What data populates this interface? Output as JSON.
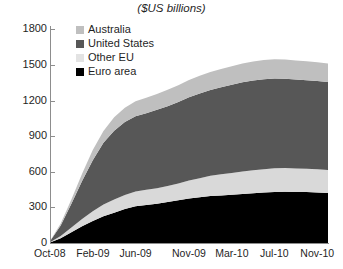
{
  "chart_data": {
    "type": "area",
    "title": "($US billions)",
    "xlabel": "",
    "ylabel": "",
    "ylim": [
      0,
      1800
    ],
    "yticks": [
      0,
      300,
      600,
      900,
      1200,
      1500,
      1800
    ],
    "grid": false,
    "stacked": true,
    "legend_position": "top-left-inside",
    "x": [
      "Oct-08",
      "Nov-08",
      "Dec-08",
      "Jan-09",
      "Feb-09",
      "Mar-09",
      "Apr-09",
      "May-09",
      "Jun-09",
      "Jul-09",
      "Aug-09",
      "Sep-09",
      "Oct-09",
      "Nov-09",
      "Dec-09",
      "Jan-10",
      "Feb-10",
      "Mar-10",
      "Apr-10",
      "May-10",
      "Jun-10",
      "Jul-10",
      "Aug-10",
      "Sep-10",
      "Oct-10",
      "Nov-10",
      "Dec-10"
    ],
    "tick_labels": [
      "Oct-08",
      "Feb-09",
      "Jun-09",
      "Nov-09",
      "Mar-10",
      "Jul-10",
      "Nov-10"
    ],
    "series": [
      {
        "name": "Euro area",
        "color": "#000000",
        "values": [
          5,
          40,
          90,
          140,
          185,
          225,
          255,
          285,
          310,
          320,
          330,
          345,
          360,
          375,
          385,
          395,
          400,
          405,
          412,
          418,
          424,
          430,
          432,
          430,
          428,
          425,
          420
        ]
      },
      {
        "name": "Other EU",
        "color": "#d9d9d9",
        "values": [
          2,
          18,
          40,
          62,
          82,
          98,
          110,
          118,
          124,
          127,
          130,
          134,
          140,
          150,
          160,
          170,
          178,
          184,
          190,
          194,
          196,
          198,
          198,
          197,
          196,
          195,
          194
        ]
      },
      {
        "name": "United States",
        "color": "#575757",
        "values": [
          8,
          90,
          200,
          320,
          430,
          520,
          580,
          615,
          632,
          645,
          660,
          672,
          685,
          700,
          712,
          722,
          732,
          742,
          750,
          755,
          758,
          756,
          752,
          748,
          744,
          742,
          740
        ]
      },
      {
        "name": "Australia",
        "color": "#bfbfbf",
        "values": [
          1,
          15,
          35,
          60,
          85,
          100,
          112,
          120,
          126,
          130,
          134,
          138,
          142,
          146,
          150,
          152,
          154,
          156,
          158,
          160,
          161,
          162,
          162,
          161,
          160,
          158,
          156
        ]
      }
    ],
    "legend": [
      {
        "label": "Australia",
        "color": "#bfbfbf"
      },
      {
        "label": "United States",
        "color": "#575757"
      },
      {
        "label": "Other EU",
        "color": "#e3e3e3"
      },
      {
        "label": "Euro area",
        "color": "#000000"
      }
    ]
  }
}
